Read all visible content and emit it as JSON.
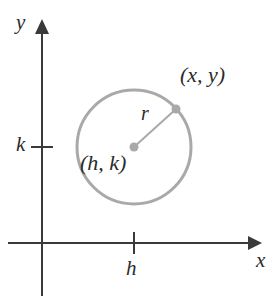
{
  "figure": {
    "background": "#ffffff"
  },
  "axes": {
    "x_label": "x",
    "y_label": "y",
    "color": "#3a3a3a",
    "origin_px": {
      "x": 42,
      "y": 243
    },
    "x_axis": {
      "start_x": 8,
      "end_x": 258,
      "y": 243,
      "arrow": "right"
    },
    "y_axis": {
      "x": 42,
      "start_y": 296,
      "end_y": 22,
      "arrow": "up"
    }
  },
  "ticks": [
    {
      "name": "k",
      "label": "k",
      "axis": "y",
      "position_px": {
        "x": 42,
        "y": 147
      }
    },
    {
      "name": "h",
      "label": "h",
      "axis": "x",
      "position_px": {
        "x": 134,
        "y": 243
      }
    }
  ],
  "circle": {
    "center_label": "(h, k)",
    "center_px": {
      "x": 134,
      "y": 147
    },
    "radius_px": 57,
    "stroke_color": "#a9a9a9",
    "stroke_width": 3,
    "fill": "none"
  },
  "radius": {
    "label": "r",
    "line_color": "#a9a9a9",
    "from_px": {
      "x": 134,
      "y": 147
    },
    "to_px": {
      "x": 176,
      "y": 109
    }
  },
  "points": [
    {
      "name": "center-point",
      "label": "(h, k)",
      "color": "#a9a9a9",
      "px": {
        "x": 134,
        "y": 147
      }
    },
    {
      "name": "circle-point",
      "label": "(x, y)",
      "color": "#a9a9a9",
      "px": {
        "x": 176,
        "y": 109
      }
    }
  ],
  "labels": {
    "point_on_circle": "(x, y)",
    "center": "(h, k)",
    "radius": "r",
    "x_axis": "x",
    "y_axis": "y",
    "tick_h": "h",
    "tick_k": "k"
  }
}
